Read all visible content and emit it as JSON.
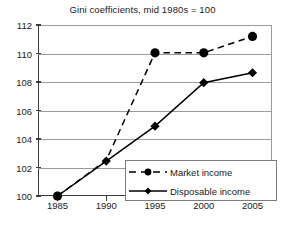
{
  "chart_data": {
    "type": "line",
    "title": "Gini coefficients, mid 1980s = 100",
    "xlabel": "",
    "ylabel": "",
    "categories": [
      "1985",
      "1990",
      "1995",
      "2000",
      "2005"
    ],
    "x": [
      1985,
      1990,
      1995,
      2000,
      2005
    ],
    "xlim": [
      1983,
      2007
    ],
    "ylim": [
      100,
      112
    ],
    "yticks": [
      100,
      102,
      104,
      106,
      108,
      110,
      112
    ],
    "xticks": [
      1985,
      1990,
      1995,
      2000,
      2005
    ],
    "grid": "horizontal",
    "legend_position": "inside lower-right",
    "series": [
      {
        "name": "Market income",
        "values": [
          100,
          102.5,
          110.05,
          110.05,
          111.2
        ],
        "linestyle": "dashed",
        "marker": "circle",
        "color": "#000000",
        "markers_shown": [
          true,
          false,
          true,
          true,
          true
        ]
      },
      {
        "name": "Disposable income",
        "values": [
          100,
          102.45,
          104.9,
          107.95,
          108.65
        ],
        "linestyle": "solid",
        "marker": "diamond",
        "color": "#000000",
        "markers_shown": [
          true,
          true,
          true,
          true,
          true
        ]
      }
    ]
  },
  "legend": {
    "items": [
      {
        "label": "Market income"
      },
      {
        "label": "Disposable income"
      }
    ]
  },
  "colors": {
    "ink": "#1a1a1a",
    "axis": "#3a3a3a",
    "grid": "#9a9a9a",
    "legend_border": "#7d7d7d",
    "background": "#ffffff"
  }
}
